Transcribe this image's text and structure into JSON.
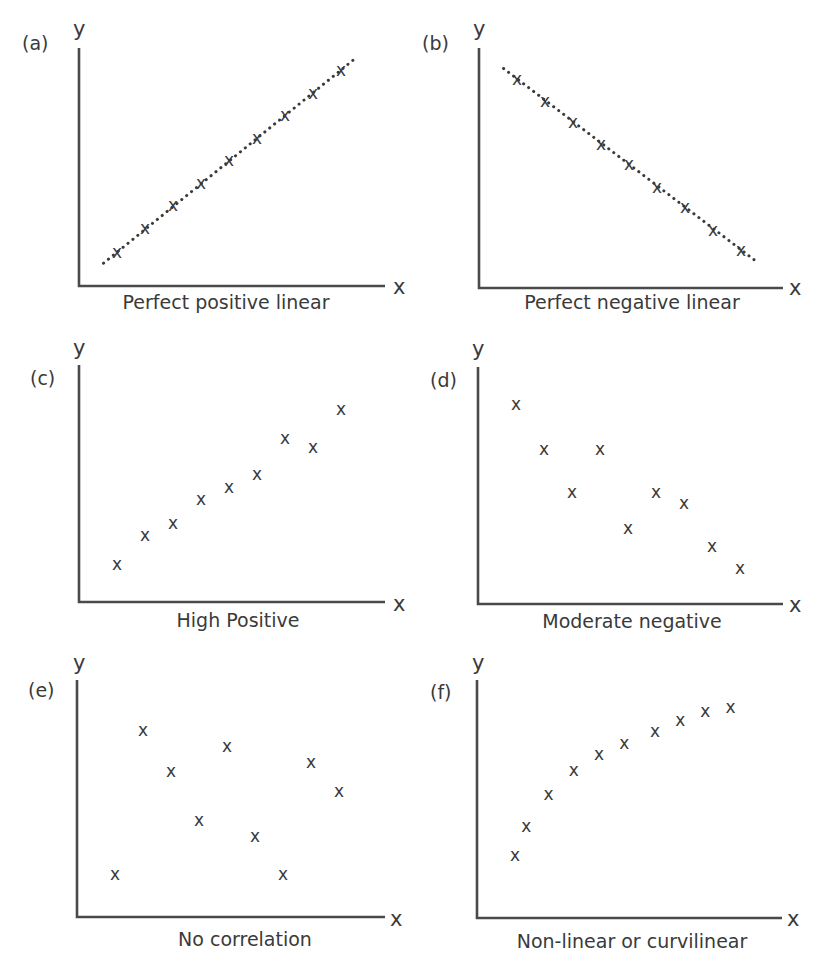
{
  "chart_data": [
    {
      "type": "scatter",
      "panel": "(a)",
      "title": "Perfect positive linear",
      "xlabel": "x",
      "ylabel": "y",
      "trendline": "dotted",
      "xlim": [
        0,
        10
      ],
      "ylim": [
        0,
        10
      ],
      "x": [
        1.0,
        2.0,
        3.0,
        4.0,
        5.0,
        6.0,
        7.0,
        8.0,
        9.0
      ],
      "y": [
        1.5,
        2.6,
        3.6,
        4.6,
        5.6,
        6.6,
        7.6,
        8.6,
        9.6
      ]
    },
    {
      "type": "scatter",
      "panel": "(b)",
      "title": "Perfect negative linear",
      "xlabel": "x",
      "ylabel": "y",
      "trendline": "dotted",
      "xlim": [
        0,
        10
      ],
      "ylim": [
        0,
        10
      ],
      "x": [
        1.0,
        2.0,
        3.0,
        4.0,
        5.0,
        6.0,
        7.0,
        8.0,
        9.0
      ],
      "y": [
        9.3,
        8.3,
        7.4,
        6.4,
        5.5,
        4.5,
        3.6,
        2.6,
        1.7
      ]
    },
    {
      "type": "scatter",
      "panel": "(c)",
      "title": "High Positive",
      "xlabel": "x",
      "ylabel": "y",
      "xlim": [
        0,
        10
      ],
      "ylim": [
        0,
        10
      ],
      "x": [
        1.0,
        2.0,
        3.0,
        4.0,
        5.0,
        6.0,
        7.0,
        8.0,
        9.0
      ],
      "y": [
        1.7,
        3.0,
        3.5,
        4.6,
        5.1,
        5.7,
        7.3,
        6.9,
        8.6
      ]
    },
    {
      "type": "scatter",
      "panel": "(d)",
      "title": "Moderate negative",
      "xlabel": "x",
      "ylabel": "y",
      "xlim": [
        0,
        10
      ],
      "ylim": [
        0,
        10
      ],
      "x": [
        1.0,
        2.0,
        3.0,
        4.0,
        5.0,
        6.0,
        7.0,
        8.0,
        9.0
      ],
      "y": [
        8.9,
        6.9,
        5.0,
        6.9,
        3.4,
        5.0,
        4.5,
        2.6,
        1.6
      ]
    },
    {
      "type": "scatter",
      "panel": "(e)",
      "title": "No correlation",
      "xlabel": "x",
      "ylabel": "y",
      "xlim": [
        0,
        10
      ],
      "ylim": [
        0,
        10
      ],
      "x": [
        1.0,
        2.0,
        3.0,
        4.0,
        5.0,
        6.0,
        7.0,
        8.0,
        9.0
      ],
      "y": [
        1.9,
        8.3,
        6.5,
        4.3,
        7.6,
        3.6,
        1.9,
        6.9,
        5.6
      ]
    },
    {
      "type": "scatter",
      "panel": "(f)",
      "title": "Non-linear or curvilinear",
      "xlabel": "x",
      "ylabel": "y",
      "xlim": [
        0,
        10
      ],
      "ylim": [
        0,
        10
      ],
      "x": [
        1.0,
        1.4,
        2.2,
        3.1,
        4.0,
        4.9,
        6.0,
        6.9,
        7.8,
        8.7
      ],
      "y": [
        2.8,
        4.1,
        5.5,
        6.6,
        7.3,
        7.8,
        8.3,
        8.8,
        9.2,
        9.4
      ]
    }
  ],
  "panels": [
    {
      "label": "(a)",
      "caption": "Perfect positive linear",
      "x_axis": "x",
      "y_axis": "y"
    },
    {
      "label": "(b)",
      "caption": "Perfect negative linear",
      "x_axis": "x",
      "y_axis": "y"
    },
    {
      "label": "(c)",
      "caption": "High Positive",
      "x_axis": "x",
      "y_axis": "y"
    },
    {
      "label": "(d)",
      "caption": "Moderate negative",
      "x_axis": "x",
      "y_axis": "y"
    },
    {
      "label": "(e)",
      "caption": "No correlation",
      "x_axis": "x",
      "y_axis": "y"
    },
    {
      "label": "(f)",
      "caption": "Non-linear or curvilinear",
      "x_axis": "x",
      "y_axis": "y"
    }
  ],
  "point_marker": "x",
  "colors": {
    "ink": "#3a3a3a",
    "axis": "#4a4a4a",
    "background": "#ffffff"
  }
}
